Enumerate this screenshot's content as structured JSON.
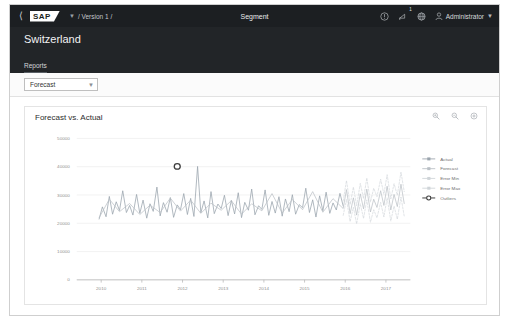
{
  "shellbar": {
    "back_icon": "back-chevron-icon",
    "logo_text": "SAP",
    "version_chevron": "chevron-down-icon",
    "breadcrumb": "/ Version 1 /",
    "title": "Segment",
    "help_icon": "help-circle-icon",
    "notifications_icon": "bell-icon",
    "notifications_badge": "1",
    "product_switch_icon": "globe-icon",
    "user_icon": "person-icon",
    "user_name": "Administrator",
    "user_chevron": "chevron-down-icon"
  },
  "object_header": {
    "title": "Switzerland",
    "tabs": [
      {
        "label": "Reports",
        "active": true
      }
    ]
  },
  "filterbar": {
    "report_select": {
      "value": "Forecast",
      "chevron": "chevron-down-icon"
    }
  },
  "card": {
    "title": "Forecast vs. Actual",
    "tools": [
      {
        "name": "zoom-in-icon"
      },
      {
        "name": "zoom-out-icon"
      },
      {
        "name": "settings-icon"
      }
    ]
  },
  "chart_data": {
    "type": "line",
    "title": "Forecast vs. Actual",
    "xlabel": "",
    "ylabel": "",
    "grid": true,
    "legend_position": "right",
    "xlim": [
      2009.4,
      2017.6
    ],
    "ylim": [
      0,
      50000
    ],
    "yticks": [
      "0",
      "10000",
      "20000",
      "30000",
      "40000",
      "50000"
    ],
    "ytick_values": [
      0,
      10000,
      20000,
      30000,
      40000,
      50000
    ],
    "xticks": [
      "2010",
      "2011",
      "2012",
      "2013",
      "2014",
      "2015",
      "2016",
      "2017"
    ],
    "xtick_values": [
      2010,
      2011,
      2012,
      2013,
      2014,
      2015,
      2016,
      2017
    ],
    "colors": {
      "actual": "#9aa4ad",
      "forecast": "#b9bfc5",
      "error_min": "#cfd4d8",
      "error_max": "#cfd4d8",
      "outliers": "#3c3c3c"
    },
    "legend": [
      {
        "label": "Actual",
        "color": "#9aa4ad",
        "marker": "line-marker"
      },
      {
        "label": "Forecast",
        "color": "#b9bfc5",
        "marker": "line-marker"
      },
      {
        "label": "Error Min",
        "color": "#cfd4d8",
        "marker": "line-marker"
      },
      {
        "label": "Error Max",
        "color": "#cfd4d8",
        "marker": "line-marker"
      },
      {
        "label": "Outliers",
        "color": "#3c3c3c",
        "marker": "circle-marker"
      }
    ],
    "series": [
      {
        "name": "Actual",
        "x": [
          2009.95,
          2010.03,
          2010.12,
          2010.2,
          2010.28,
          2010.37,
          2010.45,
          2010.53,
          2010.62,
          2010.7,
          2010.78,
          2010.87,
          2010.95,
          2011.03,
          2011.12,
          2011.2,
          2011.28,
          2011.37,
          2011.45,
          2011.53,
          2011.62,
          2011.7,
          2011.78,
          2011.87,
          2011.95,
          2012.03,
          2012.12,
          2012.2,
          2012.28,
          2012.37,
          2012.45,
          2012.53,
          2012.62,
          2012.7,
          2012.78,
          2012.87,
          2012.95,
          2013.03,
          2013.12,
          2013.2,
          2013.28,
          2013.37,
          2013.45,
          2013.53,
          2013.62,
          2013.7,
          2013.78,
          2013.87,
          2013.95,
          2014.03,
          2014.12,
          2014.2,
          2014.28,
          2014.37,
          2014.45,
          2014.53,
          2014.62,
          2014.7,
          2014.78,
          2014.87,
          2014.95,
          2015.03,
          2015.12,
          2015.2,
          2015.28,
          2015.37,
          2015.45,
          2015.53,
          2015.62,
          2015.7,
          2015.78,
          2015.87,
          2015.95
        ],
        "values": [
          21500,
          25800,
          22300,
          29500,
          23200,
          27600,
          24500,
          31500,
          23800,
          26300,
          22900,
          30200,
          23500,
          28200,
          21800,
          26900,
          24200,
          32800,
          22600,
          27300,
          23900,
          29100,
          22100,
          26500,
          24800,
          30500,
          23100,
          28800,
          22400,
          40100,
          23700,
          27900,
          21900,
          31200,
          23400,
          26800,
          25200,
          29900,
          22700,
          28100,
          23300,
          30800,
          22000,
          27400,
          24600,
          32100,
          23000,
          26200,
          24900,
          31800,
          22800,
          27700,
          23600,
          29400,
          22500,
          28600,
          24100,
          30100,
          23200,
          26600,
          25500,
          32400,
          23800,
          28300,
          22200,
          29700,
          24400,
          31000,
          23500,
          27200,
          24700,
          30600,
          26100
        ]
      },
      {
        "name": "Forecast",
        "x": [
          2009.95,
          2010.2,
          2010.45,
          2010.7,
          2010.95,
          2011.2,
          2011.45,
          2011.7,
          2011.95,
          2012.2,
          2012.45,
          2012.7,
          2012.95,
          2013.2,
          2013.45,
          2013.7,
          2013.95,
          2014.2,
          2014.45,
          2014.7,
          2014.95,
          2015.2,
          2015.45,
          2015.7,
          2015.95,
          2016.03,
          2016.12,
          2016.2,
          2016.28,
          2016.37,
          2016.45,
          2016.53,
          2016.62,
          2016.7,
          2016.78,
          2016.87,
          2016.95,
          2017.03,
          2017.12,
          2017.2,
          2017.28,
          2017.37,
          2017.45
        ],
        "values": [
          22000,
          28500,
          24100,
          27000,
          23100,
          26400,
          23800,
          28900,
          24300,
          28200,
          23500,
          27100,
          24600,
          28000,
          23200,
          26900,
          24400,
          30500,
          23600,
          28400,
          24800,
          31200,
          23900,
          28700,
          25200,
          31900,
          23400,
          29000,
          22900,
          30400,
          25100,
          32100,
          24000,
          28500,
          25600,
          31500,
          26300,
          33100,
          24700,
          30200,
          25900,
          33800,
          27000
        ]
      },
      {
        "name": "Error Min",
        "x": [
          2015.95,
          2016.03,
          2016.12,
          2016.2,
          2016.28,
          2016.37,
          2016.45,
          2016.53,
          2016.62,
          2016.7,
          2016.78,
          2016.87,
          2016.95,
          2017.03,
          2017.12,
          2017.2,
          2017.28,
          2017.37,
          2017.45
        ],
        "values": [
          22800,
          28400,
          20600,
          25700,
          19800,
          26900,
          21700,
          28300,
          20400,
          24800,
          21900,
          27400,
          22200,
          29000,
          20800,
          26100,
          21400,
          29300,
          22500
        ]
      },
      {
        "name": "Error Max",
        "x": [
          2015.95,
          2016.03,
          2016.12,
          2016.2,
          2016.28,
          2016.37,
          2016.45,
          2016.53,
          2016.62,
          2016.7,
          2016.78,
          2016.87,
          2016.95,
          2017.03,
          2017.12,
          2017.2,
          2017.28,
          2017.37,
          2017.45
        ],
        "values": [
          27900,
          35100,
          26600,
          32800,
          26200,
          34100,
          28700,
          36000,
          27500,
          32400,
          29400,
          35600,
          30300,
          37200,
          28600,
          34000,
          29900,
          38100,
          31200
        ]
      },
      {
        "name": "Outliers",
        "x": [
          2011.87
        ],
        "values": [
          40100
        ]
      }
    ]
  },
  "caption": {
    "text": ""
  }
}
